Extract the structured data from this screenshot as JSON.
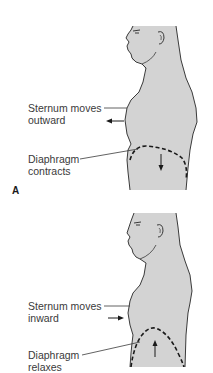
{
  "figure": {
    "body_fill": "#d3d3d3",
    "outline_color": "#3a3a3a",
    "label_color": "#3a3a3a"
  },
  "panels": [
    {
      "id": "A",
      "letter": "A",
      "phase": "inhalation",
      "sternum_label_line1": "Sternum moves",
      "sternum_label_line2": "outward",
      "sternum_arrow_direction": "left",
      "diaphragm_label_line1": "Diaphragm",
      "diaphragm_label_line2": "contracts",
      "diaphragm_arrow_direction": "down"
    },
    {
      "id": "B",
      "letter": "",
      "phase": "exhalation",
      "sternum_label_line1": "Sternum moves",
      "sternum_label_line2": "inward",
      "sternum_arrow_direction": "right",
      "diaphragm_label_line1": "Diaphragm",
      "diaphragm_label_line2": "relaxes",
      "diaphragm_arrow_direction": "up"
    }
  ]
}
